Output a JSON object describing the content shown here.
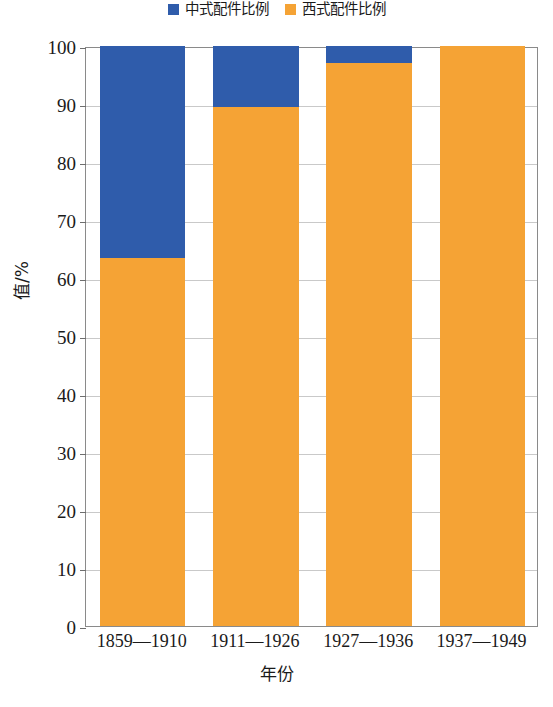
{
  "chart_data": {
    "type": "bar",
    "stacked": true,
    "percent_stacked": true,
    "title": "",
    "xlabel": "年份",
    "ylabel": "值/%",
    "categories": [
      "1859—1910",
      "1911—1926",
      "1927—1936",
      "1937—1949"
    ],
    "series": [
      {
        "name": "中式配件比例",
        "color": "#2f5cab",
        "values": [
          36.6,
          10.5,
          3.0,
          0.0
        ]
      },
      {
        "name": "西式配件比例",
        "color": "#f5a335",
        "values": [
          63.4,
          89.5,
          97.0,
          100.0
        ]
      }
    ],
    "ylim": [
      0,
      100
    ],
    "yticks": [
      0,
      10,
      20,
      30,
      40,
      50,
      60,
      70,
      80,
      90,
      100
    ],
    "ytick_labels": [
      "0",
      "10",
      "20",
      "30",
      "40",
      "50",
      "60",
      "70",
      "80",
      "90",
      "100"
    ],
    "grid": true,
    "grid_axis": "y",
    "legend_position": "top-center",
    "series_order_bottom_to_top": [
      "西式配件比例",
      "中式配件比例"
    ]
  },
  "legend": {
    "entries": [
      {
        "label": "中式配件比例",
        "color": "#2f5cab",
        "swatch_name": "legend-swatch-chinese"
      },
      {
        "label": "西式配件比例",
        "color": "#f5a335",
        "swatch_name": "legend-swatch-western"
      }
    ]
  },
  "axes": {
    "y_title": "值/%",
    "x_title": "年份"
  },
  "caption": {
    "text": ""
  }
}
